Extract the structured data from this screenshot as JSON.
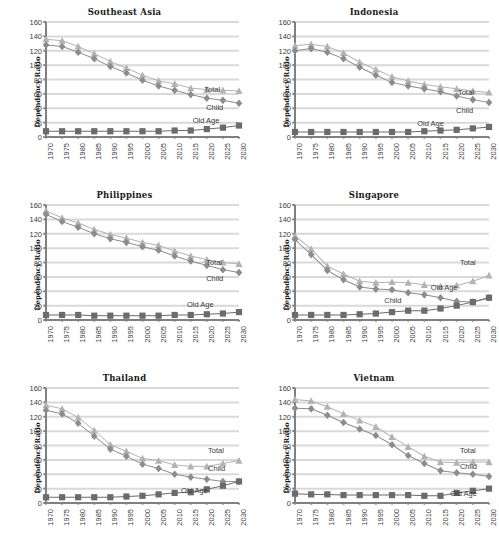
{
  "figure": {
    "ylabel": "Dependency Ratio",
    "xlabel": "",
    "ylim": [
      0,
      160
    ],
    "yticks": [
      0,
      20,
      40,
      60,
      80,
      100,
      120,
      140,
      160
    ],
    "years": [
      "1970",
      "1975",
      "1980",
      "1985",
      "1990",
      "1995",
      "2000",
      "2005",
      "2010",
      "2015",
      "2020",
      "2025",
      "2030"
    ],
    "series_names": [
      "Total",
      "Child",
      "Old Age"
    ],
    "colors": {
      "total": "#b3b3b3",
      "child": "#8c8c8c",
      "oldage": "#6b6b6b",
      "gridline": "#d9d9d9",
      "axis": "#808080",
      "text": "#3a3a3a"
    },
    "markers": {
      "total": "triangle",
      "child": "diamond",
      "oldage": "square"
    }
  },
  "chart_data": [
    {
      "type": "line",
      "title": "Southeast Asia",
      "xlabel": "",
      "ylabel": "Dependency Ratio",
      "ylim": [
        0,
        160
      ],
      "grid": true,
      "legend_position": "inline-right",
      "categories": [
        "1970",
        "1975",
        "1980",
        "1985",
        "1990",
        "1995",
        "2000",
        "2005",
        "2010",
        "2015",
        "2020",
        "2025",
        "2030"
      ],
      "series": [
        {
          "name": "Total",
          "values": [
            136,
            134,
            126,
            116,
            105,
            96,
            86,
            78,
            74,
            68,
            66,
            65,
            64
          ]
        },
        {
          "name": "Child",
          "values": [
            128,
            126,
            118,
            109,
            98,
            89,
            79,
            71,
            65,
            59,
            54,
            51,
            47
          ]
        },
        {
          "name": "Old Age",
          "values": [
            8,
            8,
            8,
            8,
            8,
            8,
            8,
            8,
            9,
            9,
            11,
            13,
            16
          ]
        }
      ]
    },
    {
      "type": "line",
      "title": "Indonesia",
      "xlabel": "",
      "ylabel": "Dependency Ratio",
      "ylim": [
        0,
        160
      ],
      "grid": true,
      "legend_position": "inline-right",
      "categories": [
        "1970",
        "1975",
        "1980",
        "1985",
        "1990",
        "1995",
        "2000",
        "2005",
        "2010",
        "2015",
        "2020",
        "2025",
        "2030"
      ],
      "series": [
        {
          "name": "Total",
          "values": [
            127,
            129,
            126,
            117,
            104,
            94,
            84,
            78,
            73,
            70,
            67,
            64,
            62
          ]
        },
        {
          "name": "Child",
          "values": [
            120,
            123,
            118,
            109,
            97,
            86,
            76,
            71,
            67,
            63,
            57,
            52,
            48
          ]
        },
        {
          "name": "Old Age",
          "values": [
            7,
            7,
            7,
            7,
            7,
            7,
            7,
            7,
            8,
            9,
            10,
            12,
            14
          ]
        }
      ]
    },
    {
      "type": "line",
      "title": "Philippines",
      "xlabel": "",
      "ylabel": "Dependency Ratio",
      "ylim": [
        0,
        160
      ],
      "grid": true,
      "legend_position": "inline-right",
      "categories": [
        "1970",
        "1975",
        "1980",
        "1985",
        "1990",
        "1995",
        "2000",
        "2005",
        "2010",
        "2015",
        "2020",
        "2025",
        "2030"
      ],
      "series": [
        {
          "name": "Total",
          "values": [
            152,
            142,
            135,
            126,
            119,
            114,
            108,
            104,
            96,
            89,
            84,
            80,
            78
          ]
        },
        {
          "name": "Child",
          "values": [
            147,
            137,
            129,
            120,
            113,
            108,
            102,
            97,
            89,
            82,
            76,
            70,
            66
          ]
        },
        {
          "name": "Old Age",
          "values": [
            7,
            7,
            7,
            6,
            6,
            6,
            6,
            6,
            7,
            7,
            8,
            9,
            11
          ]
        }
      ]
    },
    {
      "type": "line",
      "title": "Singapore",
      "xlabel": "",
      "ylabel": "Dependency Ratio",
      "ylim": [
        0,
        160
      ],
      "grid": true,
      "legend_position": "inline-right",
      "categories": [
        "1970",
        "1975",
        "1980",
        "1985",
        "1990",
        "1995",
        "2000",
        "2005",
        "2010",
        "2015",
        "2020",
        "2025",
        "2030"
      ],
      "series": [
        {
          "name": "Total",
          "values": [
            117,
            99,
            75,
            64,
            54,
            52,
            53,
            52,
            49,
            47,
            48,
            54,
            62
          ]
        },
        {
          "name": "Child",
          "values": [
            112,
            91,
            69,
            56,
            46,
            43,
            42,
            38,
            35,
            31,
            26,
            25,
            31
          ]
        },
        {
          "name": "Old Age",
          "values": [
            7,
            7,
            7,
            7,
            8,
            9,
            11,
            13,
            13,
            16,
            20,
            25,
            31
          ]
        }
      ]
    },
    {
      "type": "line",
      "title": "Thailand",
      "xlabel": "",
      "ylabel": "Dependency Ratio",
      "ylim": [
        0,
        160
      ],
      "grid": true,
      "legend_position": "inline-right",
      "categories": [
        "1970",
        "1975",
        "1980",
        "1985",
        "1990",
        "1995",
        "2000",
        "2005",
        "2010",
        "2015",
        "2020",
        "2025",
        "2030"
      ],
      "series": [
        {
          "name": "Total",
          "values": [
            136,
            131,
            119,
            101,
            81,
            72,
            62,
            59,
            53,
            51,
            51,
            55,
            59
          ]
        },
        {
          "name": "Child",
          "values": [
            129,
            124,
            111,
            93,
            75,
            65,
            54,
            48,
            40,
            36,
            33,
            30,
            30
          ]
        },
        {
          "name": "Old Age",
          "values": [
            8,
            8,
            8,
            8,
            8,
            9,
            10,
            12,
            14,
            15,
            19,
            24,
            30
          ]
        }
      ]
    },
    {
      "type": "line",
      "title": "Vietnam",
      "xlabel": "",
      "ylabel": "Dependency Ratio",
      "ylim": [
        0,
        160
      ],
      "grid": true,
      "legend_position": "inline-right",
      "categories": [
        "1970",
        "1975",
        "1980",
        "1985",
        "1990",
        "1995",
        "2000",
        "2005",
        "2010",
        "2015",
        "2020",
        "2025",
        "2030"
      ],
      "series": [
        {
          "name": "Total",
          "values": [
            144,
            142,
            134,
            124,
            115,
            106,
            92,
            78,
            65,
            57,
            56,
            57,
            57
          ]
        },
        {
          "name": "Child",
          "values": [
            132,
            131,
            122,
            112,
            103,
            94,
            81,
            66,
            55,
            45,
            42,
            40,
            37
          ]
        },
        {
          "name": "Old Age",
          "values": [
            13,
            12,
            12,
            11,
            11,
            11,
            11,
            11,
            10,
            10,
            14,
            17,
            20
          ]
        }
      ]
    }
  ],
  "series_label_positions": [
    {
      "total": {
        "x": 82,
        "y": 55
      },
      "child": {
        "x": 83,
        "y": 70
      },
      "oldage": {
        "x": 76,
        "y": 82
      }
    },
    {
      "total": {
        "x": 84,
        "y": 57
      },
      "child": {
        "x": 83,
        "y": 73
      },
      "oldage": {
        "x": 63,
        "y": 84
      }
    },
    {
      "total": {
        "x": 83,
        "y": 46
      },
      "child": {
        "x": 83,
        "y": 60
      },
      "oldage": {
        "x": 73,
        "y": 83
      }
    },
    {
      "total": {
        "x": 85,
        "y": 46
      },
      "child": {
        "x": 46,
        "y": 79
      },
      "oldage": {
        "x": 70,
        "y": 68
      }
    },
    {
      "total": {
        "x": 84,
        "y": 50
      },
      "child": {
        "x": 84,
        "y": 66
      },
      "oldage": {
        "x": 70,
        "y": 85
      }
    },
    {
      "total": {
        "x": 85,
        "y": 50
      },
      "child": {
        "x": 85,
        "y": 64
      },
      "oldage": {
        "x": 80,
        "y": 88
      }
    }
  ],
  "footnote": ""
}
